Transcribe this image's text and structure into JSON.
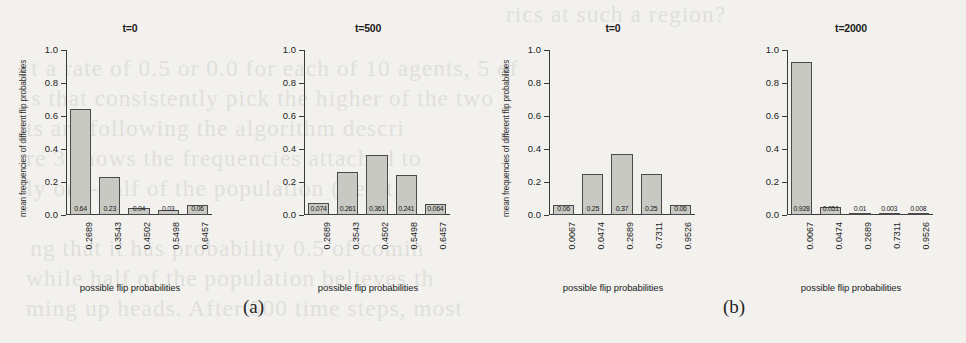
{
  "figure": {
    "background_color": "#f2f1ee",
    "bar_fill_color": "#c9c9c4",
    "bar_border_color": "#4a4a4a",
    "axis_color": "#3a3a3a",
    "captions": [
      {
        "name": "caption-a",
        "text": "(a)"
      },
      {
        "name": "caption-b",
        "text": "(b)"
      }
    ]
  },
  "bleed_text": [
    "rics at such a region?",
    "t a rate of 0.5 or 0.0 for each of 10 agents, 5 of",
    "s that consistently pick the higher of the two",
    "ts are following the algorithm descri",
    "re 3 shows the frequencies attached to",
    "ly one-half of the population (i.e., th",
    "ng that it has probability 0.5 of comin",
    "while half of the population believes th",
    "ming up heads. After 500 time steps, most"
  ],
  "chart_data": [
    {
      "name": "panel-t0-a",
      "type": "bar",
      "title": "t=0",
      "xlabel": "possible flip probabilities",
      "ylabel": "mean frequencies of different flip probabilities",
      "categories": [
        "0.2689",
        "0.3543",
        "0.4502",
        "0.5498",
        "0.6457"
      ],
      "values": [
        0.64,
        0.23,
        0.04,
        0.03,
        0.06
      ],
      "value_labels": [
        "0.64",
        "0.23",
        "0.04",
        "0.03",
        "0.06"
      ],
      "ylim": [
        0.0,
        1.0
      ],
      "yticks": [
        "0.0",
        "0.2",
        "0.4",
        "0.6",
        "0.8",
        "1.0"
      ],
      "ytick_values": [
        0.0,
        0.2,
        0.4,
        0.6,
        0.8,
        1.0
      ],
      "grid": false,
      "legend": "none"
    },
    {
      "name": "panel-t500",
      "type": "bar",
      "title": "t=500",
      "xlabel": "possible flip probabilities",
      "ylabel": "",
      "categories": [
        "0.2689",
        "0.3543",
        "0.4502",
        "0.5498",
        "0.6457"
      ],
      "values": [
        0.074,
        0.261,
        0.361,
        0.241,
        0.064
      ],
      "value_labels": [
        "0.074",
        "0.261",
        "0.361",
        "0.241",
        "0.064"
      ],
      "ylim": [
        0.0,
        1.0
      ],
      "yticks": [
        "0.0",
        "0.2",
        "0.4",
        "0.6",
        "0.8",
        "1.0"
      ],
      "ytick_values": [
        0.0,
        0.2,
        0.4,
        0.6,
        0.8,
        1.0
      ],
      "grid": false,
      "legend": "none"
    },
    {
      "name": "panel-t0-b",
      "type": "bar",
      "title": "t=0",
      "xlabel": "possible flip probabilities",
      "ylabel": "mean frequencies of different flip probabilities",
      "categories": [
        "0.0067",
        "0.0474",
        "0.2689",
        "0.7311",
        "0.9526"
      ],
      "values": [
        0.06,
        0.25,
        0.37,
        0.25,
        0.06
      ],
      "value_labels": [
        "0.06",
        "0.25",
        "0.37",
        "0.25",
        "0.06"
      ],
      "ylim": [
        0.0,
        1.0
      ],
      "yticks": [
        "0.0",
        "0.2",
        "0.4",
        "0.6",
        "0.8",
        "1.0"
      ],
      "ytick_values": [
        0.0,
        0.2,
        0.4,
        0.6,
        0.8,
        1.0
      ],
      "grid": false,
      "legend": "none"
    },
    {
      "name": "panel-t2000",
      "type": "bar",
      "title": "t=2000",
      "xlabel": "possible flip probabilities",
      "ylabel": "",
      "categories": [
        "0.0067",
        "0.0474",
        "0.2689",
        "0.7311",
        "0.9526"
      ],
      "values": [
        0.928,
        0.051,
        0.01,
        0.003,
        0.008
      ],
      "value_labels": [
        "0.928",
        "0.051",
        "0.01",
        "0.003",
        "0.008"
      ],
      "ylim": [
        0.0,
        1.0
      ],
      "yticks": [
        "0.0",
        "0.2",
        "0.4",
        "0.6",
        "0.8",
        "1.0"
      ],
      "ytick_values": [
        0.0,
        0.2,
        0.4,
        0.6,
        0.8,
        1.0
      ],
      "grid": false,
      "legend": "none"
    }
  ]
}
